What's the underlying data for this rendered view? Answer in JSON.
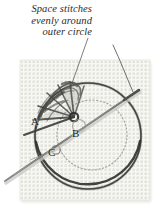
{
  "figure": {
    "kind": "embroidery-instruction-illustration",
    "background_color": "#ffffff"
  },
  "caption": {
    "name": "instruction-caption",
    "lines": [
      "Space stitches",
      "evenly around",
      "outer circle"
    ],
    "style": "italic-serif",
    "color": "#2b2b2b"
  },
  "leader_line": {
    "name": "caption-leader-line",
    "from": {
      "x": 88,
      "y": 38
    },
    "to": {
      "x": 70,
      "y": 88
    },
    "color": "#555555"
  },
  "fabric": {
    "name": "aida-cloth-swatch",
    "left": 20,
    "top": 60,
    "width": 130,
    "height": 140,
    "weave_color": "#d6d6cf",
    "base_color": "#f7f7f3",
    "hole_spacing": 4
  },
  "outer_circle": {
    "name": "outer-guide-circle",
    "cx": 88,
    "cy": 136,
    "r": 53,
    "color": "#4a4a48",
    "style": "solid-dark-thread"
  },
  "inner_circle": {
    "name": "inner-guide-circle",
    "cx": 92,
    "cy": 135,
    "r": 35,
    "color": "#9a9a95",
    "style": "dotted-pencil-guideline"
  },
  "center_hub": {
    "name": "stitch-center-hub",
    "cx": 74,
    "cy": 117,
    "r": 9,
    "color": "#3a3a38"
  },
  "needle": {
    "name": "embroidery-needle",
    "tip": {
      "x": 5,
      "y": 181
    },
    "eye_end": {
      "x": 139,
      "y": 90
    },
    "color": "#6e6e6e",
    "width": 2.1
  },
  "thread_tail": {
    "name": "thread-tail",
    "from": {
      "x": 131,
      "y": 94
    },
    "to": {
      "x": 113,
      "y": 45
    },
    "color": "#5a5a58"
  },
  "spokes": {
    "name": "spoke-stitch-group",
    "color": "#3d3d3b",
    "count": 7,
    "angles_deg": [
      160,
      183,
      205,
      226,
      248,
      268,
      292
    ]
  },
  "point_labels": [
    {
      "name": "point-label-a",
      "text": "A",
      "x": 31,
      "y": 116
    },
    {
      "name": "point-label-b",
      "text": "B",
      "x": 72,
      "y": 128
    },
    {
      "name": "point-label-c",
      "text": "C",
      "x": 48,
      "y": 147
    }
  ],
  "colors": {
    "ink": "#2b2b2b",
    "thread_dark": "#3d3d3b",
    "guideline": "#9a9a95",
    "needle_metal": "#6e6e6e",
    "fabric": "#f7f7f3"
  }
}
